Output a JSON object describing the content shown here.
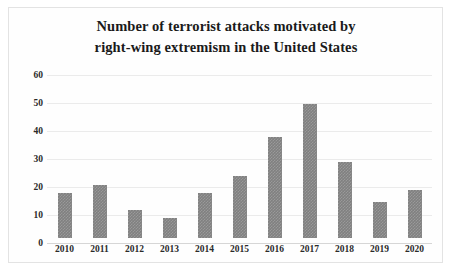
{
  "chart_data": {
    "type": "bar",
    "title": "Number of terrorist attacks motivated by right-wing extremism in the United States",
    "title_lines": [
      "Number of terrorist attacks motivated by",
      "right-wing extremism in the United States"
    ],
    "categories": [
      "2010",
      "2011",
      "2012",
      "2013",
      "2014",
      "2015",
      "2016",
      "2017",
      "2018",
      "2019",
      "2020"
    ],
    "values": [
      16,
      19,
      10,
      7,
      16,
      22,
      36,
      48,
      27,
      13,
      17
    ],
    "xlabel": "",
    "ylabel": "",
    "ylim": [
      0,
      60
    ],
    "yticks": [
      0,
      10,
      20,
      30,
      40,
      50,
      60
    ],
    "ytick_labels": [
      "0",
      "10",
      "20",
      "30",
      "40",
      "50",
      "60"
    ],
    "grid": true,
    "legend": false,
    "bar_color": "#808080",
    "grid_color": "#ebebeb",
    "border_color": "#e3e3e3",
    "background": "#ffffff"
  }
}
